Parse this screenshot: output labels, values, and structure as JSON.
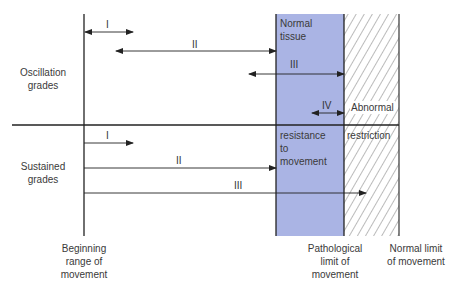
{
  "diagram": {
    "colors": {
      "normal_tissue_fill": "#aab4e4",
      "line": "#222222",
      "hatch": "#555555"
    },
    "row_labels": {
      "oscillation": [
        "Oscillation",
        "grades"
      ],
      "sustained": [
        "Sustained",
        "grades"
      ]
    },
    "region_labels": {
      "normal_tissue_top": [
        "Normal",
        "tissue"
      ],
      "normal_tissue_bottom": [
        "resistance",
        "to",
        "movement"
      ],
      "abnormal_top": "Abnormal",
      "abnormal_bottom": "restriction"
    },
    "axis_labels": {
      "beginning": [
        "Beginning",
        "range of",
        "movement"
      ],
      "pathological": [
        "Pathological",
        "limit of",
        "movement"
      ],
      "normal_limit": [
        "Normal limit",
        "of movement"
      ]
    },
    "oscillation_grades": [
      {
        "label": "I",
        "x1": 84,
        "x2": 133,
        "y": 32,
        "both": true
      },
      {
        "label": "II",
        "x1": 116,
        "x2": 276,
        "y": 51,
        "both": true
      },
      {
        "label": "III",
        "x1": 249,
        "x2": 344,
        "y": 74,
        "both": true
      },
      {
        "label": "IV",
        "x1": 312,
        "x2": 344,
        "y": 113,
        "both": true
      }
    ],
    "sustained_grades": [
      {
        "label": "I",
        "x1": 84,
        "x2": 133,
        "y": 143
      },
      {
        "label": "II",
        "x1": 84,
        "x2": 276,
        "y": 168
      },
      {
        "label": "III",
        "x1": 84,
        "x2": 366,
        "y": 193
      }
    ]
  }
}
